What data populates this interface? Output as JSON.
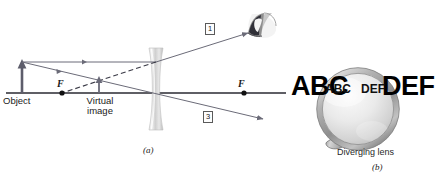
{
  "figure": {
    "panel_a": {
      "caption": "(a)",
      "object_label": "Object",
      "image_label_line1": "Virtual",
      "image_label_line2": "image",
      "focal_point_left_label": "F",
      "focal_point_right_label": "F",
      "ray_tag_1": "1",
      "ray_tag_3": "3",
      "eye_icon_name": "eye-icon",
      "lens_icon_name": "diverging-lens-shape"
    },
    "panel_b": {
      "caption": "(b)",
      "lens_caption": "Diverging lens",
      "background_text_left": "ABC",
      "background_text_right": "DEF",
      "magnified_text_left": "ABC",
      "magnified_text_right": "DEF",
      "magnifier_icon_name": "magnifying-glass-icon"
    }
  },
  "colors": {
    "ray_solid": "#6b6b78",
    "ray_dashed": "#3a3a46",
    "axis": "#2a2a32",
    "object_arrow": "#5d5d6b",
    "lens_glass": "#c9c9c9",
    "magnifier_rim": "#9a9a9a",
    "text": "#1a1a1a"
  }
}
